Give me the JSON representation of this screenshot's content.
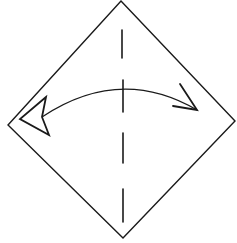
{
  "diagram": {
    "type": "origami-step",
    "colors": {
      "background": "#ffffff",
      "stroke": "#1a1a1a"
    },
    "paper": {
      "shape": "diamond",
      "vertices": {
        "top": [
          121,
          1
        ],
        "right": [
          235,
          121
        ],
        "bottom": [
          123,
          238
        ],
        "left": [
          8,
          125
        ]
      }
    },
    "fold_line": {
      "style": "dashed",
      "kind": "valley-fold",
      "dashes": [
        {
          "x1": 122,
          "y1": 30,
          "x2": 122,
          "y2": 58
        },
        {
          "x1": 123,
          "y1": 80,
          "x2": 123,
          "y2": 112
        },
        {
          "x1": 123,
          "y1": 133,
          "x2": 123,
          "y2": 163
        },
        {
          "x1": 123,
          "y1": 189,
          "x2": 123,
          "y2": 222
        }
      ]
    },
    "arrow": {
      "kind": "fold-and-unfold",
      "curve": {
        "start": [
          42,
          117
        ],
        "control": [
          120,
          65
        ],
        "end": [
          197,
          110
        ]
      },
      "right_head": {
        "points": [
          [
            180,
            84
          ],
          [
            197,
            110
          ],
          [
            173,
            106
          ]
        ],
        "style": "open"
      },
      "left_head": {
        "points": [
          [
            46,
            97
          ],
          [
            20,
            119
          ],
          [
            49,
            135
          ],
          [
            42,
            117
          ]
        ],
        "style": "hollow-triangle"
      }
    }
  }
}
